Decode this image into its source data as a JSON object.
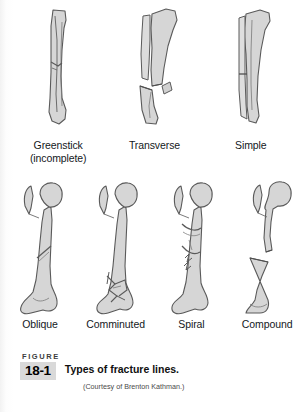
{
  "figure": {
    "figure_word": "FIGURE",
    "number": "18-1",
    "title": "Types of fracture lines.",
    "credit": "(Courtesy of Brenton Kathman.)"
  },
  "colors": {
    "bone_fill": "#d6d6d6",
    "bone_fill_light": "#e2e2e2",
    "bone_outline": "#5a5a5a",
    "fracture_line": "#6b6b6b",
    "badge_gray": "#d9d9d9",
    "page_background": "#ffffff",
    "label_text": "#14181c"
  },
  "rows": [
    {
      "name": "upper-row",
      "bone_type": "tibia",
      "items": [
        {
          "id": "greenstick",
          "label_line1": "Greenstick",
          "label_line2": "(incomplete)",
          "icon": "greenstick-fracture-illustration"
        },
        {
          "id": "transverse",
          "label_line1": "Transverse",
          "label_line2": "",
          "icon": "transverse-fracture-illustration"
        },
        {
          "id": "simple",
          "label_line1": "Simple",
          "label_line2": "",
          "icon": "simple-fracture-illustration"
        }
      ]
    },
    {
      "name": "lower-row",
      "bone_type": "femur",
      "items": [
        {
          "id": "oblique",
          "label_line1": "Oblique",
          "label_line2": "",
          "icon": "oblique-fracture-illustration"
        },
        {
          "id": "comminuted",
          "label_line1": "Comminuted",
          "label_line2": "",
          "icon": "comminuted-fracture-illustration"
        },
        {
          "id": "spiral",
          "label_line1": "Spiral",
          "label_line2": "",
          "icon": "spiral-fracture-illustration"
        },
        {
          "id": "compound",
          "label_line1": "Compound",
          "label_line2": "",
          "icon": "compound-fracture-illustration"
        }
      ]
    }
  ]
}
